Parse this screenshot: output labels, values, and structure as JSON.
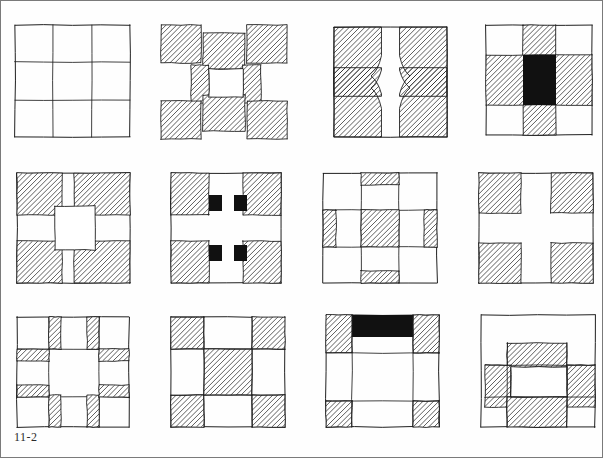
{
  "page": {
    "figure_label": "11-2",
    "background_color": "#fefefe",
    "ink_color": "#1f1f1f",
    "hatch_color": "#2a2a2a",
    "solid_fill_color": "#111111",
    "white_fill_color": "#ffffff",
    "columns": 4,
    "rows": 3,
    "block_count": 12
  },
  "blocks": [
    {
      "index": 1,
      "row": 1,
      "col": 1,
      "name": "plain-nine-patch-grid",
      "description": "Plain 3 by 3 grid, no shading",
      "x": 14,
      "y": 24,
      "w": 115,
      "h": 112,
      "shapes": [
        {
          "kind": "outline",
          "x": 0,
          "y": 0,
          "w": 115,
          "h": 112
        },
        {
          "kind": "line",
          "x1": 38,
          "y1": 0,
          "x2": 38,
          "y2": 112
        },
        {
          "kind": "line",
          "x1": 77,
          "y1": 0,
          "x2": 77,
          "y2": 112
        },
        {
          "kind": "line",
          "x1": 0,
          "y1": 37,
          "x2": 115,
          "y2": 37
        },
        {
          "kind": "line",
          "x1": 0,
          "y1": 75,
          "x2": 115,
          "y2": 75
        }
      ]
    },
    {
      "index": 2,
      "row": 1,
      "col": 2,
      "name": "offset-h-block",
      "description": "Offset hatched corners and bars forming an H, white centre",
      "x": 160,
      "y": 24,
      "w": 126,
      "h": 114,
      "shapes": [
        {
          "kind": "hatch",
          "x": 0,
          "y": 0,
          "w": 40,
          "h": 38
        },
        {
          "kind": "hatch",
          "x": 86,
          "y": 0,
          "w": 40,
          "h": 38
        },
        {
          "kind": "hatch",
          "x": 42,
          "y": 8,
          "w": 42,
          "h": 36
        },
        {
          "kind": "hatch",
          "x": 30,
          "y": 40,
          "w": 18,
          "h": 38
        },
        {
          "kind": "hatch",
          "x": 82,
          "y": 40,
          "w": 18,
          "h": 38
        },
        {
          "kind": "hatch",
          "x": 0,
          "y": 76,
          "w": 40,
          "h": 38
        },
        {
          "kind": "hatch",
          "x": 86,
          "y": 76,
          "w": 40,
          "h": 38
        },
        {
          "kind": "hatch",
          "x": 42,
          "y": 70,
          "w": 42,
          "h": 36
        },
        {
          "kind": "white",
          "x": 48,
          "y": 44,
          "w": 34,
          "h": 28
        }
      ]
    },
    {
      "index": 3,
      "row": 1,
      "col": 3,
      "name": "curved-cross-block",
      "description": "Four hatched corners with concave curved inner corners forming a white cross",
      "x": 333,
      "y": 26,
      "w": 113,
      "h": 110,
      "shapes": [
        {
          "kind": "outline",
          "x": 0,
          "y": 0,
          "w": 113,
          "h": 110
        },
        {
          "kind": "curved-corner",
          "corner": "tl"
        },
        {
          "kind": "curved-corner",
          "corner": "tr"
        },
        {
          "kind": "curved-corner",
          "corner": "bl"
        },
        {
          "kind": "curved-corner",
          "corner": "br"
        }
      ]
    },
    {
      "index": 4,
      "row": 1,
      "col": 4,
      "name": "hatched-cross-black-centre",
      "description": "Hatched cross with a solid black centre square, white corners",
      "x": 485,
      "y": 24,
      "w": 106,
      "h": 110,
      "shapes": [
        {
          "kind": "outline",
          "x": 0,
          "y": 0,
          "w": 106,
          "h": 110
        },
        {
          "kind": "hatch",
          "x": 37,
          "y": 0,
          "w": 33,
          "h": 110
        },
        {
          "kind": "hatch",
          "x": 0,
          "y": 30,
          "w": 106,
          "h": 50
        },
        {
          "kind": "solid",
          "x": 37,
          "y": 30,
          "w": 33,
          "h": 50
        }
      ]
    },
    {
      "index": 5,
      "row": 2,
      "col": 1,
      "name": "hatched-corners-white-cross-square",
      "description": "Four hatched corners, white cross with a larger white centre square",
      "x": 16,
      "y": 172,
      "w": 113,
      "h": 110,
      "shapes": [
        {
          "kind": "outline",
          "x": 0,
          "y": 0,
          "w": 113,
          "h": 110
        },
        {
          "kind": "hatch",
          "x": 0,
          "y": 0,
          "w": 45,
          "h": 42
        },
        {
          "kind": "hatch",
          "x": 57,
          "y": 0,
          "w": 56,
          "h": 42
        },
        {
          "kind": "hatch",
          "x": 0,
          "y": 68,
          "w": 45,
          "h": 42
        },
        {
          "kind": "hatch",
          "x": 57,
          "y": 68,
          "w": 56,
          "h": 42
        },
        {
          "kind": "white",
          "x": 38,
          "y": 33,
          "w": 40,
          "h": 44
        }
      ]
    },
    {
      "index": 6,
      "row": 2,
      "col": 2,
      "name": "cross-with-black-bar-pairs",
      "description": "Hatched corners, white cross, two black-white-black bars top and bottom",
      "x": 170,
      "y": 172,
      "w": 110,
      "h": 110,
      "shapes": [
        {
          "kind": "outline",
          "x": 0,
          "y": 0,
          "w": 110,
          "h": 110
        },
        {
          "kind": "hatch",
          "x": 0,
          "y": 0,
          "w": 38,
          "h": 42
        },
        {
          "kind": "hatch",
          "x": 72,
          "y": 0,
          "w": 38,
          "h": 42
        },
        {
          "kind": "hatch",
          "x": 0,
          "y": 68,
          "w": 38,
          "h": 42
        },
        {
          "kind": "hatch",
          "x": 72,
          "y": 68,
          "w": 38,
          "h": 42
        },
        {
          "kind": "solid",
          "x": 38,
          "y": 22,
          "w": 13,
          "h": 16
        },
        {
          "kind": "solid",
          "x": 63,
          "y": 22,
          "w": 13,
          "h": 16
        },
        {
          "kind": "solid",
          "x": 38,
          "y": 72,
          "w": 13,
          "h": 16
        },
        {
          "kind": "solid",
          "x": 63,
          "y": 72,
          "w": 13,
          "h": 16
        }
      ]
    },
    {
      "index": 7,
      "row": 2,
      "col": 3,
      "name": "hatched-centre-with-edge-bars",
      "description": "Hatched centre square with thin hatched bars at the inner edge of each side cell",
      "x": 322,
      "y": 172,
      "w": 114,
      "h": 110,
      "shapes": [
        {
          "kind": "outline",
          "x": 0,
          "y": 0,
          "w": 114,
          "h": 110
        },
        {
          "kind": "line",
          "x1": 38,
          "y1": 0,
          "x2": 38,
          "y2": 110
        },
        {
          "kind": "line",
          "x1": 76,
          "y1": 0,
          "x2": 76,
          "y2": 110
        },
        {
          "kind": "line",
          "x1": 0,
          "y1": 37,
          "x2": 114,
          "y2": 37
        },
        {
          "kind": "line",
          "x1": 0,
          "y1": 74,
          "x2": 114,
          "y2": 74
        },
        {
          "kind": "hatch",
          "x": 38,
          "y": 37,
          "w": 38,
          "h": 37
        },
        {
          "kind": "hatch",
          "x": 38,
          "y": 0,
          "w": 38,
          "h": 12
        },
        {
          "kind": "hatch",
          "x": 38,
          "y": 98,
          "w": 38,
          "h": 12
        },
        {
          "kind": "hatch",
          "x": 0,
          "y": 37,
          "w": 13,
          "h": 37
        },
        {
          "kind": "hatch",
          "x": 101,
          "y": 37,
          "w": 13,
          "h": 37
        }
      ]
    },
    {
      "index": 8,
      "row": 2,
      "col": 4,
      "name": "hatched-corners-plain-white-cross",
      "description": "Four hatched corner squares forming a plain white cross",
      "x": 478,
      "y": 172,
      "w": 114,
      "h": 110,
      "shapes": [
        {
          "kind": "outline",
          "x": 0,
          "y": 0,
          "w": 114,
          "h": 110
        },
        {
          "kind": "hatch",
          "x": 0,
          "y": 0,
          "w": 42,
          "h": 40
        },
        {
          "kind": "hatch",
          "x": 72,
          "y": 0,
          "w": 42,
          "h": 40
        },
        {
          "kind": "hatch",
          "x": 0,
          "y": 70,
          "w": 42,
          "h": 40
        },
        {
          "kind": "hatch",
          "x": 72,
          "y": 70,
          "w": 42,
          "h": 40
        }
      ]
    },
    {
      "index": 9,
      "row": 3,
      "col": 1,
      "name": "thin-sashing-ring-block",
      "description": "Large white centre framed by thin hatched sashing bars beside each corner",
      "x": 16,
      "y": 316,
      "w": 112,
      "h": 110,
      "shapes": [
        {
          "kind": "outline",
          "x": 0,
          "y": 0,
          "w": 112,
          "h": 110
        },
        {
          "kind": "line",
          "x1": 0,
          "y1": 32,
          "x2": 112,
          "y2": 32
        },
        {
          "kind": "line",
          "x1": 0,
          "y1": 80,
          "x2": 112,
          "y2": 80
        },
        {
          "kind": "line",
          "x1": 32,
          "y1": 0,
          "x2": 32,
          "y2": 110
        },
        {
          "kind": "line",
          "x1": 82,
          "y1": 0,
          "x2": 82,
          "y2": 110
        },
        {
          "kind": "hatch",
          "x": 32,
          "y": 0,
          "w": 12,
          "h": 32
        },
        {
          "kind": "hatch",
          "x": 70,
          "y": 0,
          "w": 12,
          "h": 32
        },
        {
          "kind": "hatch",
          "x": 32,
          "y": 78,
          "w": 12,
          "h": 32
        },
        {
          "kind": "hatch",
          "x": 70,
          "y": 78,
          "w": 12,
          "h": 32
        },
        {
          "kind": "hatch",
          "x": 0,
          "y": 32,
          "w": 32,
          "h": 12
        },
        {
          "kind": "hatch",
          "x": 82,
          "y": 32,
          "w": 30,
          "h": 12
        },
        {
          "kind": "hatch",
          "x": 0,
          "y": 68,
          "w": 32,
          "h": 12
        },
        {
          "kind": "hatch",
          "x": 82,
          "y": 68,
          "w": 30,
          "h": 12
        }
      ]
    },
    {
      "index": 10,
      "row": 3,
      "col": 2,
      "name": "classic-nine-patch",
      "description": "Classic nine-patch: hatched corners and hatched centre",
      "x": 170,
      "y": 316,
      "w": 114,
      "h": 110,
      "shapes": [
        {
          "kind": "outline",
          "x": 0,
          "y": 0,
          "w": 114,
          "h": 110
        },
        {
          "kind": "hatch",
          "x": 0,
          "y": 0,
          "w": 33,
          "h": 32
        },
        {
          "kind": "hatch",
          "x": 81,
          "y": 0,
          "w": 33,
          "h": 32
        },
        {
          "kind": "hatch",
          "x": 0,
          "y": 78,
          "w": 33,
          "h": 32
        },
        {
          "kind": "hatch",
          "x": 81,
          "y": 78,
          "w": 33,
          "h": 32
        },
        {
          "kind": "hatch",
          "x": 33,
          "y": 32,
          "w": 48,
          "h": 46
        },
        {
          "kind": "line",
          "x1": 33,
          "y1": 0,
          "x2": 33,
          "y2": 110
        },
        {
          "kind": "line",
          "x1": 81,
          "y1": 0,
          "x2": 81,
          "y2": 110
        },
        {
          "kind": "line",
          "x1": 0,
          "y1": 32,
          "x2": 114,
          "y2": 32
        },
        {
          "kind": "line",
          "x1": 0,
          "y1": 78,
          "x2": 114,
          "y2": 78
        }
      ]
    },
    {
      "index": 11,
      "row": 3,
      "col": 3,
      "name": "black-top-bar-block",
      "description": "Hatched corner squares with a solid black bar across the top centre",
      "x": 325,
      "y": 314,
      "w": 113,
      "h": 112,
      "shapes": [
        {
          "kind": "outline",
          "x": 0,
          "y": 0,
          "w": 113,
          "h": 112
        },
        {
          "kind": "hatch",
          "x": 0,
          "y": 0,
          "w": 26,
          "h": 38
        },
        {
          "kind": "hatch",
          "x": 87,
          "y": 0,
          "w": 26,
          "h": 38
        },
        {
          "kind": "hatch",
          "x": 0,
          "y": 86,
          "w": 26,
          "h": 26
        },
        {
          "kind": "hatch",
          "x": 87,
          "y": 86,
          "w": 26,
          "h": 26
        },
        {
          "kind": "solid",
          "x": 26,
          "y": 0,
          "w": 61,
          "h": 22
        },
        {
          "kind": "line",
          "x1": 0,
          "y1": 38,
          "x2": 113,
          "y2": 38
        },
        {
          "kind": "line",
          "x1": 0,
          "y1": 86,
          "x2": 113,
          "y2": 86
        },
        {
          "kind": "line",
          "x1": 26,
          "y1": 0,
          "x2": 26,
          "y2": 112
        },
        {
          "kind": "line",
          "x1": 87,
          "y1": 0,
          "x2": 87,
          "y2": 112
        }
      ]
    },
    {
      "index": 12,
      "row": 3,
      "col": 4,
      "name": "offset-hatched-ring-block",
      "description": "Offset hatched bars forming a ring around a white centre, white upper band",
      "x": 480,
      "y": 314,
      "w": 114,
      "h": 112,
      "shapes": [
        {
          "kind": "outline",
          "x": 0,
          "y": 0,
          "w": 114,
          "h": 112
        },
        {
          "kind": "hatch",
          "x": 26,
          "y": 28,
          "w": 60,
          "h": 24
        },
        {
          "kind": "hatch",
          "x": 4,
          "y": 50,
          "w": 26,
          "h": 42
        },
        {
          "kind": "hatch",
          "x": 86,
          "y": 50,
          "w": 28,
          "h": 42
        },
        {
          "kind": "hatch",
          "x": 26,
          "y": 82,
          "w": 60,
          "h": 30
        },
        {
          "kind": "white",
          "x": 30,
          "y": 52,
          "w": 56,
          "h": 30
        },
        {
          "kind": "line",
          "x1": 4,
          "y1": 50,
          "x2": 114,
          "y2": 50
        },
        {
          "kind": "line",
          "x1": 4,
          "y1": 82,
          "x2": 114,
          "y2": 82
        },
        {
          "kind": "line",
          "x1": 26,
          "y1": 28,
          "x2": 26,
          "y2": 112
        },
        {
          "kind": "line",
          "x1": 86,
          "y1": 28,
          "x2": 86,
          "y2": 112
        }
      ]
    }
  ]
}
